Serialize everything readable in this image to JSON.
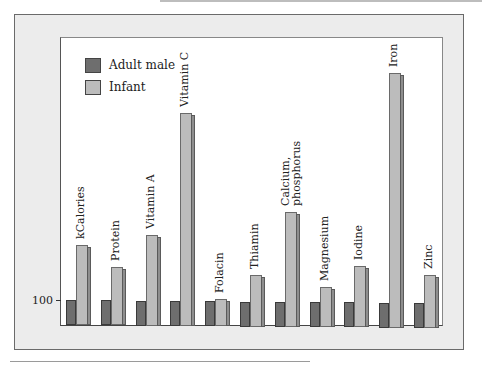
{
  "chart_data": {
    "type": "bar",
    "title": "",
    "xlabel": "",
    "ylabel": "",
    "y_tick_labels": [
      "100"
    ],
    "categories": [
      "kCalories",
      "Protein",
      "Vitamin A",
      "Vitamin C",
      "Folacin",
      "Thiamin",
      "Calcium, phosphorus",
      "Magnesium",
      "Iodine",
      "Iron",
      "Zinc"
    ],
    "series": [
      {
        "name": "Adult male",
        "color": "#6e6e6e",
        "values": [
          100,
          100,
          100,
          100,
          100,
          100,
          100,
          100,
          100,
          100,
          100
        ]
      },
      {
        "name": "Infant",
        "color": "#bcbcbc",
        "values": [
          320,
          232,
          364,
          852,
          108,
          208,
          460,
          160,
          244,
          1020,
          212
        ]
      }
    ],
    "legend_position": "upper-left",
    "grid": false
  },
  "legend": {
    "items": [
      {
        "label": "Adult male"
      },
      {
        "label": "Infant"
      }
    ]
  },
  "axis": {
    "tick_100": "100"
  },
  "labels": {
    "c0": "kCalories",
    "c1": "Protein",
    "c2": "Vitamin A",
    "c3": "Vitamin C",
    "c4": "Folacin",
    "c5": "Thiamin",
    "c6a": "Calcium,",
    "c6b": "phosphorus",
    "c7": "Magnesium",
    "c8": "Iodine",
    "c9": "Iron",
    "c10": "Zinc"
  }
}
